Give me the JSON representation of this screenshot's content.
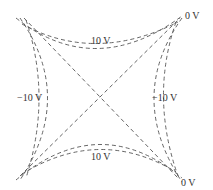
{
  "diagram": {
    "type": "equipotential-lines",
    "line_style": "dashed",
    "line_color": "#555555",
    "labels": {
      "top_curve": "10 V",
      "bottom_curve": "10 V",
      "left_curve": "−10 V",
      "right_curve": "−10 V",
      "diagonal_top_right": "0 V",
      "diagonal_bottom_right": "0 V"
    }
  }
}
